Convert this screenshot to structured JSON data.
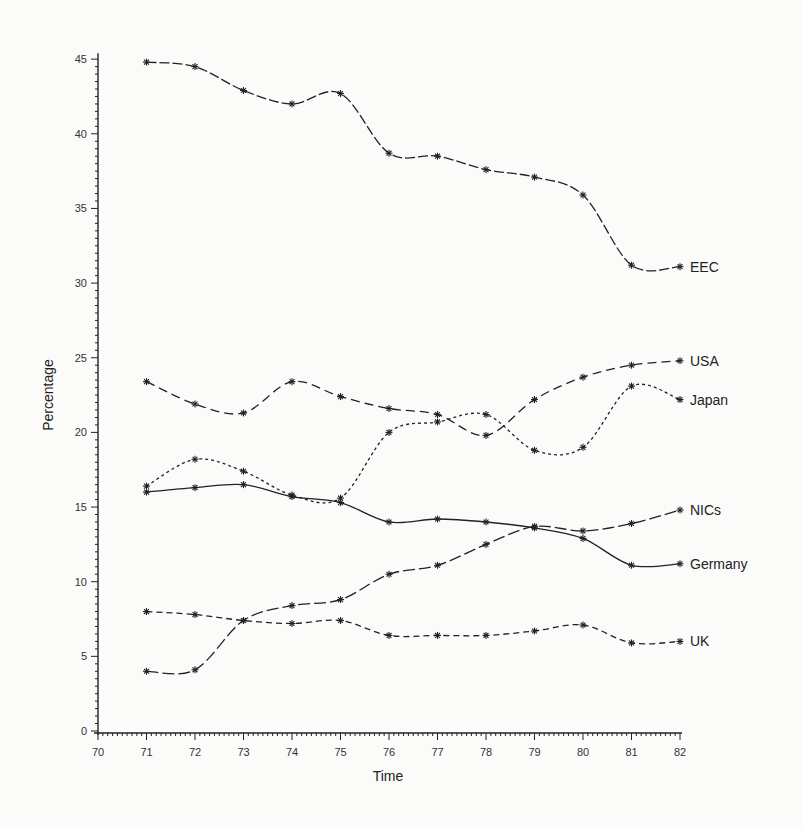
{
  "chart_data": {
    "type": "line",
    "title": "",
    "xlabel": "Time",
    "ylabel": "Percentage",
    "x": [
      71,
      72,
      73,
      74,
      75,
      76,
      77,
      78,
      79,
      80,
      81,
      82
    ],
    "x_ticks": [
      "70",
      "71",
      "72",
      "73",
      "74",
      "75",
      "76",
      "77",
      "78",
      "79",
      "80",
      "81",
      "82"
    ],
    "y_ticks": [
      "0",
      "5",
      "10",
      "15",
      "20",
      "25",
      "30",
      "35",
      "40",
      "45"
    ],
    "xlim": [
      70,
      82
    ],
    "ylim": [
      0,
      45
    ],
    "grid": false,
    "legend_position": "inline-right",
    "series": [
      {
        "name": "EEC",
        "dash": "10,3",
        "values": [
          44.8,
          44.5,
          42.9,
          42.0,
          42.7,
          38.7,
          38.5,
          37.6,
          37.1,
          35.9,
          31.2,
          31.1
        ]
      },
      {
        "name": "USA",
        "dash": "9,5",
        "values": [
          23.4,
          21.9,
          21.3,
          23.4,
          22.4,
          21.6,
          21.2,
          19.8,
          22.2,
          23.7,
          24.5,
          24.8
        ]
      },
      {
        "name": "Japan",
        "dash": "3,3",
        "values": [
          16.4,
          18.2,
          17.4,
          15.8,
          15.6,
          20.0,
          20.7,
          21.2,
          18.8,
          19.0,
          23.1,
          22.2
        ]
      },
      {
        "name": "NICs",
        "dash": "12,4",
        "values": [
          4.0,
          4.1,
          7.4,
          8.4,
          8.8,
          10.5,
          11.1,
          12.5,
          13.7,
          13.4,
          13.9,
          14.8
        ]
      },
      {
        "name": "Germany",
        "dash": "",
        "values": [
          16.0,
          16.3,
          16.5,
          15.7,
          15.3,
          14.0,
          14.2,
          14.0,
          13.6,
          12.9,
          11.1,
          11.2
        ]
      },
      {
        "name": "UK",
        "dash": "6,4",
        "values": [
          8.0,
          7.8,
          7.4,
          7.2,
          7.4,
          6.4,
          6.4,
          6.4,
          6.7,
          7.1,
          5.9,
          6.0
        ]
      }
    ]
  }
}
